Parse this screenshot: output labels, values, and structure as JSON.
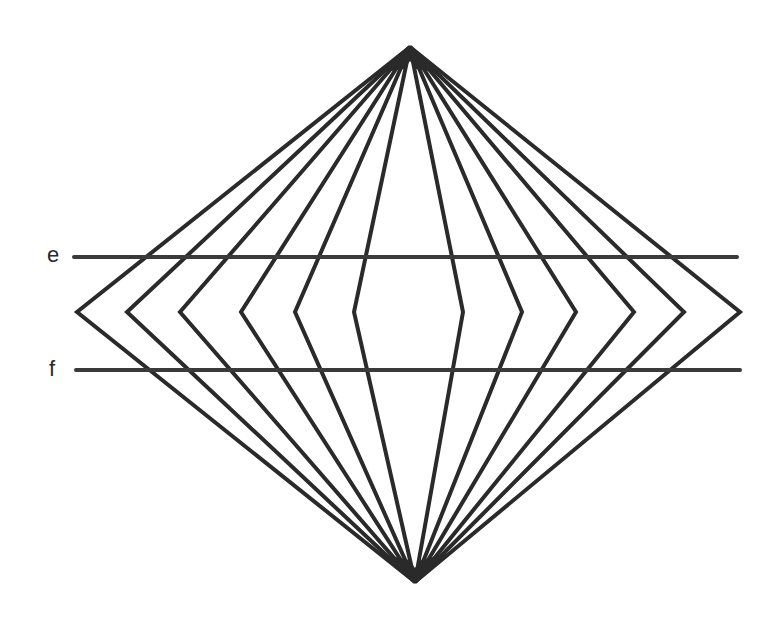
{
  "figure": {
    "type": "optical-illusion",
    "stroke_color": "#2a2a2a",
    "background": "#ffffff",
    "top_apex": [
      410,
      47
    ],
    "bottom_apex": [
      415,
      582
    ],
    "mid_y": 312,
    "vertices_left_x": [
      77,
      127,
      180,
      241,
      295,
      354
    ],
    "vertices_right_x": [
      463,
      522,
      576,
      634,
      684,
      740
    ],
    "lines": [
      {
        "label": "e",
        "y": 257,
        "x1": 74,
        "x2": 737
      },
      {
        "label": "f",
        "y": 370,
        "x1": 76,
        "x2": 740
      }
    ]
  }
}
